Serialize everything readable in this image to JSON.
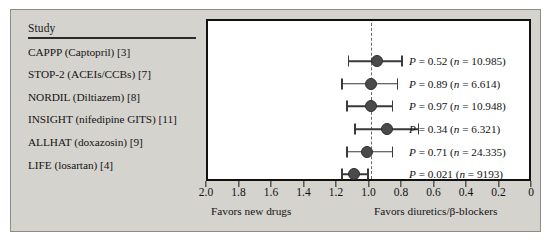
{
  "figure": {
    "background_color": "#d5d3ce",
    "plot_background_color": "#ffffff",
    "marker_color": "#4a4a4a",
    "line_color": "#3a3a3a",
    "reference_line_color": "#6b6b6b",
    "axis_color": "#111111"
  },
  "study_column": {
    "header": "Study"
  },
  "axis": {
    "caption_left": "Favors new drugs",
    "caption_right": "Favors diuretics/β-blockers",
    "tick_labels": [
      "2.0",
      "1.8",
      "1.6",
      "1.4",
      "1.2",
      "1.0",
      "0.8",
      "0.6",
      "0.4",
      "0.2",
      "0"
    ]
  },
  "chart_data": {
    "type": "scatter",
    "subtype": "forest-plot",
    "title": "",
    "xlabel": "",
    "ylabel": "",
    "xlim": [
      2.0,
      0.0
    ],
    "x_axis_reversed": true,
    "xticks": [
      2.0,
      1.8,
      1.6,
      1.4,
      1.2,
      1.0,
      0.8,
      0.6,
      0.4,
      0.2,
      0.0
    ],
    "xtick_labels": [
      "2.0",
      "1.8",
      "1.6",
      "1.4",
      "1.2",
      "1.0",
      "0.8",
      "0.6",
      "0.4",
      "0.2",
      "0"
    ],
    "grid": false,
    "legend": false,
    "reference_line": 1.0,
    "axis_caption_left": "Favors new drugs",
    "axis_caption_right": "Favors diuretics/β-blockers",
    "columns": [
      "Study",
      "Estimate",
      "CI low",
      "CI high",
      "P value",
      "n"
    ],
    "rows": [
      {
        "study": "CAPPP (Captopril) [3]",
        "estimate": 0.96,
        "ci_low": 0.81,
        "ci_high": 1.14,
        "p_label": "P = 0.52 (n = 10.985)",
        "p_value": "0.52",
        "n": "10.985"
      },
      {
        "study": "STOP-2 (ACEIs/CCBs) [7]",
        "estimate": 1.0,
        "ci_low": 0.84,
        "ci_high": 1.18,
        "p_label": "P = 0.89 (n = 6.614)",
        "p_value": "0.89",
        "n": "6.614"
      },
      {
        "study": "NORDIL (Diltiazem) [8]",
        "estimate": 1.0,
        "ci_low": 0.87,
        "ci_high": 1.15,
        "p_label": "P = 0.97 (n = 10.948)",
        "p_value": "0.97",
        "n": "10.948"
      },
      {
        "study": "INSIGHT (nifedipine GITS) [11]",
        "estimate": 0.9,
        "ci_low": 0.71,
        "ci_high": 1.1,
        "p_label": "P = 0.34 (n = 6.321)",
        "p_value": "0.34",
        "n": "6.321"
      },
      {
        "study": "ALLHAT (doxazosin) [9]",
        "estimate": 1.02,
        "ci_low": 0.87,
        "ci_high": 1.15,
        "p_label": "P = 0.71 (n = 24.335)",
        "p_value": "0.71",
        "n": "24.335"
      },
      {
        "study": "LIFE (losartan) [4]",
        "estimate": 1.1,
        "ci_low": 1.02,
        "ci_high": 1.18,
        "p_label": "P = 0.021 (n = 9193)",
        "p_value": "0.021",
        "n": "9193"
      }
    ]
  }
}
